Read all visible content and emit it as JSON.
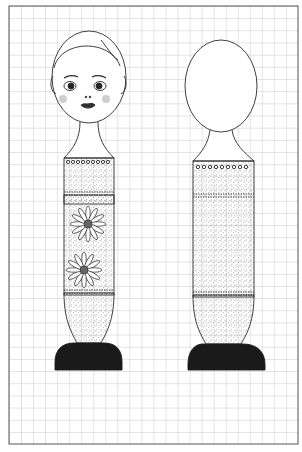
{
  "figure": {
    "background": "#ffffff",
    "grid": {
      "x0": 9,
      "y0": 6,
      "x1": 298,
      "y1": 444,
      "cell": 12.04,
      "line_color": "#b8b8b8",
      "border_color": "#555555"
    },
    "colors": {
      "ink": "#2a2a2a",
      "base": "#1a1a1a",
      "stipple": "#555555",
      "cheek": "#9a9a9a"
    },
    "views": [
      {
        "name": "front",
        "cx": 89,
        "has_face": true,
        "flowers": 2
      },
      {
        "name": "back",
        "cx": 219,
        "has_face": false,
        "flowers": 0
      }
    ],
    "caption": ""
  }
}
